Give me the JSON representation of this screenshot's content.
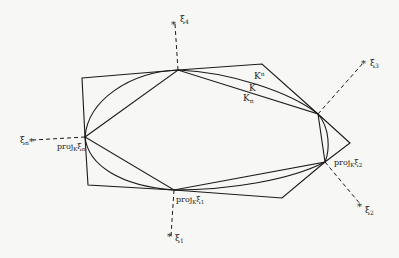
{
  "diagram": {
    "labels": {
      "xi4": "ξ",
      "xi4_sub": "4",
      "xi3": "ξ",
      "xi3_sub": "3",
      "xin": "ξ",
      "xin_sub": "n",
      "xi1": "ξ",
      "xi1_sub": "1",
      "xi2": "ξ",
      "xi2_sub": "2",
      "Kn_upper": "K",
      "Kn_upper_sup": "n",
      "K": "K",
      "Kn_lower": "K",
      "Kn_lower_sub": "n",
      "proj_n": "proj",
      "proj_n_sub": "K",
      "proj_n_xi": "ξ",
      "proj_n_xi_sub": "n",
      "proj_1": "proj",
      "proj_1_sub": "K",
      "proj_1_xi": "ξ",
      "proj_1_xi_sub": "1",
      "proj_2": "proj",
      "proj_2_sub": "K",
      "proj_2_xi": "ξ",
      "proj_2_xi_sub": "2"
    },
    "colors": {
      "line": "#1a1a1a",
      "background": "#f7f7f5"
    }
  }
}
